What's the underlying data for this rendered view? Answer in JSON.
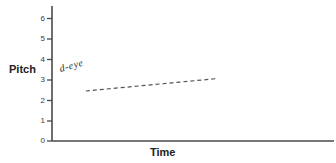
{
  "chart_data": {
    "type": "line",
    "title": "",
    "xlabel": "Time",
    "ylabel": "Pitch",
    "grid": false,
    "legend": "none",
    "x_ticks": [],
    "y_ticks": [
      "0",
      "1",
      "2",
      "3",
      "4",
      "5",
      "6"
    ],
    "ylim": [
      0,
      6.4
    ],
    "series": [
      {
        "name": "d-eye",
        "style": "dashed",
        "color": "#555555",
        "points": [
          {
            "x": 0.12,
            "y": 2.45
          },
          {
            "x": 0.58,
            "y": 3.05
          }
        ]
      }
    ],
    "annotations": [
      {
        "text": "d-eye",
        "handwritten": true,
        "rotation_deg": -16,
        "x": 0.14,
        "y": 3.4
      }
    ]
  },
  "axes": {
    "y_axis_label": "Pitch",
    "x_axis_label": "Time",
    "tick_labels": [
      "6",
      "5",
      "4",
      "3",
      "2",
      "1",
      "0"
    ],
    "axis_color": "#4a4a4a"
  },
  "colors": {
    "background": "#ffffff",
    "axis": "#4a4a4a",
    "text": "#222222",
    "series": "#555555"
  }
}
